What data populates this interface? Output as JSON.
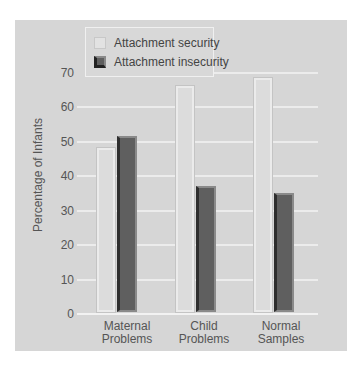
{
  "chart_data": {
    "type": "bar",
    "title": "",
    "xlabel": "",
    "ylabel": "Percentage of Infants",
    "ylim": [
      0,
      70
    ],
    "yticks": [
      0,
      10,
      20,
      30,
      40,
      50,
      60,
      70
    ],
    "grid": true,
    "legend_position": "top-left-inside",
    "categories": [
      "Maternal Problems",
      "Child Problems",
      "Normal Samples"
    ],
    "category_lines": [
      [
        "Maternal",
        "Problems"
      ],
      [
        "Child",
        "Problems"
      ],
      [
        "Normal",
        "Samples"
      ]
    ],
    "series": [
      {
        "name": "Attachment security",
        "values": [
          48,
          66,
          68.5
        ],
        "color": "#dcdcdc"
      },
      {
        "name": "Attachment insecurity",
        "values": [
          51.5,
          37,
          35
        ],
        "color": "#5f5f5f"
      }
    ]
  },
  "legend": {
    "items": [
      {
        "label": "Attachment security"
      },
      {
        "label": "Attachment insecurity"
      }
    ]
  },
  "axis": {
    "ylabel": "Percentage of Infants",
    "ticks": [
      "0",
      "10",
      "20",
      "30",
      "40",
      "50",
      "60",
      "70"
    ]
  },
  "xlabels": [
    {
      "line1": "Maternal",
      "line2": "Problems"
    },
    {
      "line1": "Child",
      "line2": "Problems"
    },
    {
      "line1": "Normal",
      "line2": "Samples"
    }
  ]
}
